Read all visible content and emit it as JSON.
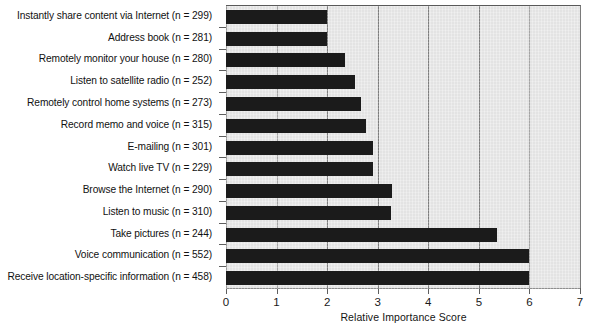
{
  "chart_data": {
    "type": "bar",
    "orientation": "horizontal",
    "title": "",
    "xlabel": "Relative Importance Score",
    "ylabel": "",
    "xlim": [
      0,
      7
    ],
    "xticks": [
      "0",
      "1",
      "2",
      "3",
      "4",
      "5",
      "6",
      "7"
    ],
    "grid": true,
    "legend": "none",
    "categories": [
      "Instantly share content via Internet (n = 299)",
      "Address book (n = 281)",
      "Remotely monitor your house (n = 280)",
      "Listen to satellite radio (n = 252)",
      "Remotely control home systems (n = 273)",
      "Record memo and voice (n = 315)",
      "E-mailing (n = 301)",
      "Watch live TV (n = 229)",
      "Browse the Internet (n = 290)",
      "Listen to music (n = 310)",
      "Take pictures (n = 244)",
      "Voice communication (n = 552)",
      "Receive location-specific information (n = 458)"
    ],
    "values": [
      2.0,
      2.0,
      2.35,
      2.55,
      2.67,
      2.77,
      2.9,
      2.9,
      3.28,
      3.27,
      5.35,
      6.0,
      6.0
    ],
    "colors": {
      "bar": "#1b1b1b",
      "plot_background": "#e3e3e3",
      "gridline": "#7d7d7d",
      "axis": "#6e6e6e",
      "text": "#111111",
      "page_background": "#ffffff"
    }
  }
}
